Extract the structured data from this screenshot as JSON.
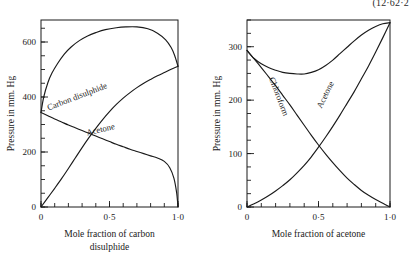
{
  "corner_note": "(12·62·2",
  "chart_data": [
    {
      "id": "left",
      "type": "line",
      "title": "",
      "xlabel_lines": [
        "Mole fraction of carbon",
        "disulphide"
      ],
      "ylabel": "Pressure in mm. Hg",
      "xlim": [
        0,
        1
      ],
      "ylim": [
        0,
        680
      ],
      "grid": false,
      "legend": "inline-curve-labels",
      "xticks": [
        0,
        0.5,
        1.0
      ],
      "xticklabels": [
        "0",
        "0·5",
        "1·0"
      ],
      "xminor_step": 0.1,
      "yticks": [
        0,
        200,
        400,
        600
      ],
      "yticklabels": [
        "0",
        "200",
        "400",
        "600"
      ],
      "yminor_step": 50,
      "series": [
        {
          "name": "Total vapour pressure",
          "label": "",
          "label_rotation": 0,
          "points": [
            [
              0.0,
              344
            ],
            [
              0.02,
              400
            ],
            [
              0.05,
              452
            ],
            [
              0.08,
              487
            ],
            [
              0.12,
              521
            ],
            [
              0.17,
              556
            ],
            [
              0.22,
              582
            ],
            [
              0.28,
              605
            ],
            [
              0.34,
              622
            ],
            [
              0.4,
              634
            ],
            [
              0.47,
              645
            ],
            [
              0.55,
              652
            ],
            [
              0.62,
              655
            ],
            [
              0.7,
              655
            ],
            [
              0.78,
              648
            ],
            [
              0.85,
              632
            ],
            [
              0.91,
              608
            ],
            [
              0.95,
              580
            ],
            [
              0.975,
              552
            ],
            [
              1.0,
              512
            ]
          ]
        },
        {
          "name": "Carbon disulphide",
          "label": "Carbon disulphide",
          "label_rotation": -21,
          "label_x": 0.27,
          "label_y": 392,
          "points": [
            [
              0.0,
              0
            ],
            [
              0.05,
              34
            ],
            [
              0.1,
              68
            ],
            [
              0.15,
              103
            ],
            [
              0.2,
              140
            ],
            [
              0.25,
              178
            ],
            [
              0.3,
              216
            ],
            [
              0.35,
              252
            ],
            [
              0.4,
              286
            ],
            [
              0.45,
              318
            ],
            [
              0.5,
              347
            ],
            [
              0.55,
              373
            ],
            [
              0.6,
              396
            ],
            [
              0.65,
              416
            ],
            [
              0.7,
              434
            ],
            [
              0.75,
              450
            ],
            [
              0.8,
              464
            ],
            [
              0.85,
              477
            ],
            [
              0.9,
              489
            ],
            [
              0.95,
              501
            ],
            [
              1.0,
              512
            ]
          ]
        },
        {
          "name": "Acetone",
          "label": "Acetone",
          "label_rotation": -13,
          "label_x": 0.44,
          "label_y": 272,
          "points": [
            [
              0.0,
              344
            ],
            [
              0.05,
              332
            ],
            [
              0.1,
              320
            ],
            [
              0.15,
              309
            ],
            [
              0.2,
              298
            ],
            [
              0.25,
              288
            ],
            [
              0.3,
              278
            ],
            [
              0.35,
              268
            ],
            [
              0.4,
              258
            ],
            [
              0.45,
              248
            ],
            [
              0.5,
              238
            ],
            [
              0.55,
              228
            ],
            [
              0.6,
              219
            ],
            [
              0.65,
              210
            ],
            [
              0.7,
              202
            ],
            [
              0.75,
              194
            ],
            [
              0.8,
              186
            ],
            [
              0.85,
              178
            ],
            [
              0.9,
              166
            ],
            [
              0.94,
              143
            ],
            [
              0.97,
              105
            ],
            [
              0.99,
              52
            ],
            [
              1.0,
              0
            ]
          ]
        }
      ]
    },
    {
      "id": "right",
      "type": "line",
      "title": "",
      "xlabel_lines": [
        "Mole fraction of acetone"
      ],
      "ylabel": "Pressure in mm. Hg",
      "xlim": [
        0,
        1
      ],
      "ylim": [
        0,
        350
      ],
      "grid": false,
      "legend": "inline-curve-labels",
      "xticks": [
        0,
        0.5,
        1.0
      ],
      "xticklabels": [
        "0",
        "0·5",
        "1·0"
      ],
      "xminor_step": 0.1,
      "yticks": [
        0,
        100,
        200,
        300
      ],
      "yticklabels": [
        "0",
        "100",
        "200",
        "300"
      ],
      "yminor_step": 25,
      "series": [
        {
          "name": "Total vapour pressure",
          "label": "",
          "label_rotation": 0,
          "points": [
            [
              0.0,
              293
            ],
            [
              0.05,
              278
            ],
            [
              0.1,
              268
            ],
            [
              0.15,
              261
            ],
            [
              0.2,
              256
            ],
            [
              0.25,
              252
            ],
            [
              0.3,
              250
            ],
            [
              0.35,
              249
            ],
            [
              0.4,
              249
            ],
            [
              0.45,
              252
            ],
            [
              0.5,
              257
            ],
            [
              0.55,
              265
            ],
            [
              0.6,
              275
            ],
            [
              0.65,
              287
            ],
            [
              0.7,
              299
            ],
            [
              0.75,
              311
            ],
            [
              0.8,
              322
            ],
            [
              0.85,
              331
            ],
            [
              0.9,
              338
            ],
            [
              0.95,
              343
            ],
            [
              1.0,
              345
            ]
          ]
        },
        {
          "name": "Chloroform",
          "label": "Chloroform",
          "label_rotation": 69,
          "label_x": 0.205,
          "label_y": 205,
          "points": [
            [
              0.0,
              293
            ],
            [
              0.05,
              277
            ],
            [
              0.1,
              261
            ],
            [
              0.15,
              244
            ],
            [
              0.2,
              227
            ],
            [
              0.25,
              209
            ],
            [
              0.3,
              191
            ],
            [
              0.35,
              172
            ],
            [
              0.4,
              153
            ],
            [
              0.45,
              134
            ],
            [
              0.5,
              116
            ],
            [
              0.55,
              99
            ],
            [
              0.6,
              83
            ],
            [
              0.65,
              68
            ],
            [
              0.7,
              54
            ],
            [
              0.75,
              42
            ],
            [
              0.8,
              31
            ],
            [
              0.85,
              22
            ],
            [
              0.9,
              14
            ],
            [
              0.95,
              7
            ],
            [
              1.0,
              0
            ]
          ]
        },
        {
          "name": "Acetone",
          "label": "Acetone",
          "label_rotation": -64,
          "label_x": 0.565,
          "label_y": 208,
          "points": [
            [
              0.0,
              0
            ],
            [
              0.05,
              6
            ],
            [
              0.1,
              13
            ],
            [
              0.15,
              21
            ],
            [
              0.2,
              30
            ],
            [
              0.25,
              40
            ],
            [
              0.3,
              51
            ],
            [
              0.35,
              64
            ],
            [
              0.4,
              78
            ],
            [
              0.45,
              94
            ],
            [
              0.5,
              112
            ],
            [
              0.55,
              131
            ],
            [
              0.6,
              151
            ],
            [
              0.65,
              172
            ],
            [
              0.7,
              194
            ],
            [
              0.75,
              216
            ],
            [
              0.8,
              240
            ],
            [
              0.85,
              264
            ],
            [
              0.9,
              290
            ],
            [
              0.95,
              317
            ],
            [
              1.0,
              345
            ]
          ]
        }
      ]
    }
  ]
}
